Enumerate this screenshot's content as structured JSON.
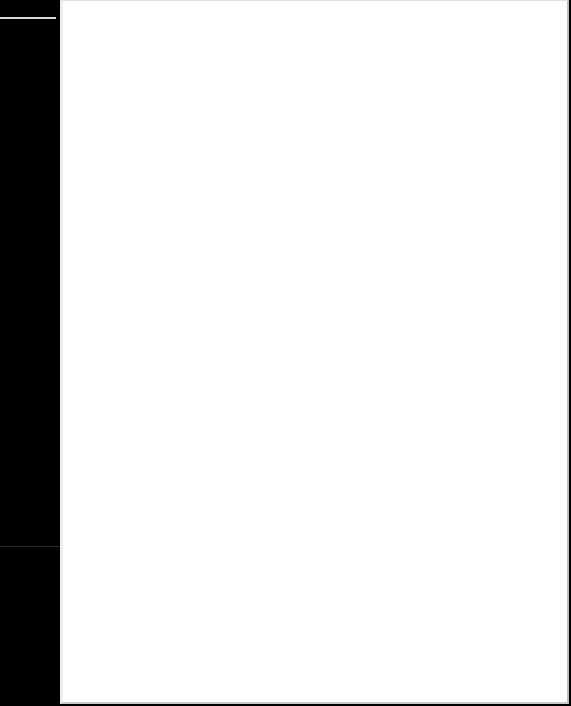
{
  "document": {
    "page_text": "",
    "colors": {
      "margin": "#000000",
      "page": "#ffffff"
    }
  }
}
